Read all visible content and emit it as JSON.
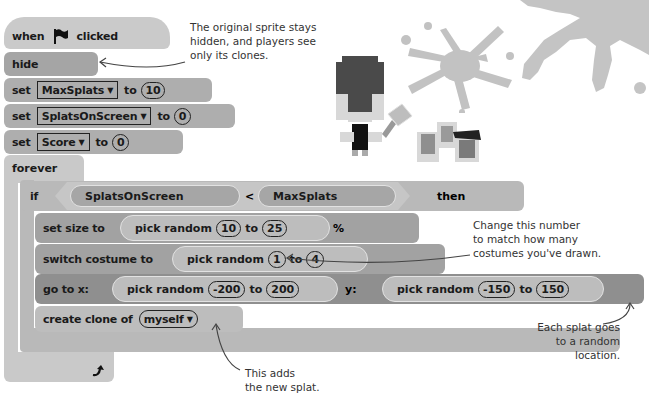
{
  "script": {
    "hat": {
      "when": "when",
      "clicked": "clicked",
      "icon": "green-flag-icon"
    },
    "hide": "hide",
    "set_blocks": [
      {
        "set": "set",
        "variable": "MaxSplats",
        "to": "to",
        "value": "10"
      },
      {
        "set": "set",
        "variable": "SplatsOnScreen",
        "to": "to",
        "value": "0"
      },
      {
        "set": "set",
        "variable": "Score",
        "to": "to",
        "value": "0"
      }
    ],
    "forever": "forever",
    "if_block": {
      "if": "if",
      "left": "SplatsOnScreen",
      "op": "<",
      "right": "MaxSplats",
      "then": "then"
    },
    "set_size": {
      "label": "set size to",
      "pick": "pick random",
      "from": "10",
      "to": "to",
      "to_val": "25",
      "suffix": "%"
    },
    "switch_costume": {
      "label": "switch costume to",
      "pick": "pick random",
      "from": "1",
      "to": "to",
      "to_val": "4"
    },
    "go_to": {
      "label_x": "go to x:",
      "x_pick": "pick random",
      "x_from": "-200",
      "x_to": "to",
      "x_to_val": "200",
      "label_y": "y:",
      "y_pick": "pick random",
      "y_from": "-150",
      "y_to": "to",
      "y_to_val": "150"
    },
    "create_clone": {
      "label": "create clone of",
      "target": "myself"
    },
    "loop_arrow": "loop-arrow-icon"
  },
  "annotations": {
    "hide_note": [
      "The original sprite stays",
      "hidden, and players see",
      "only its clones."
    ],
    "costume_note": [
      "Change this number",
      "to match how many",
      "costumes you've drawn."
    ],
    "location_note": [
      "Each splat goes",
      "to a random",
      "location."
    ],
    "clone_note": [
      "This adds",
      "the new splat."
    ]
  },
  "colors": {
    "hat": "#c9c9c9",
    "looks": "#9f9f9f",
    "data": "#b0b0b0",
    "control": "#c9c9c9",
    "motion": "#8e8e8e"
  }
}
